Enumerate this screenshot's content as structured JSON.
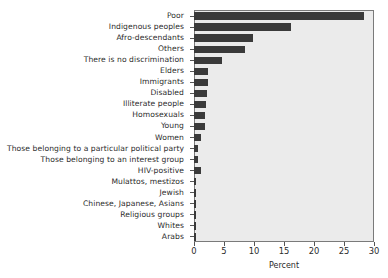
{
  "chart_data": {
    "type": "bar",
    "orientation": "horizontal",
    "title": "",
    "xlabel": "Percent",
    "ylabel": "",
    "xlim": [
      0,
      30
    ],
    "xticks": [
      0,
      5,
      10,
      15,
      20,
      25,
      30
    ],
    "grid": false,
    "legend": null,
    "bar_color": "#3a3a3a",
    "plot_background": "#ebebeb",
    "categories": [
      "Poor",
      "Indigenous peoples",
      "Afro-descendants",
      "Others",
      "There is no discrimination",
      "Elders",
      "Immigrants",
      "Disabled",
      "Illiterate people",
      "Homosexuals",
      "Young",
      "Women",
      "Those belonging to a particular political party",
      "Those belonging to an interest group",
      "HIV-positive",
      "Mulattos, mestizos",
      "Jewish",
      "Chinese, Japanese, Asians",
      "Religious groups",
      "Whites",
      "Arabs"
    ],
    "values": [
      28.3,
      16.2,
      9.8,
      8.5,
      4.7,
      2.4,
      2.4,
      2.1,
      2.0,
      1.9,
      1.8,
      1.2,
      0.7,
      0.6,
      1.1,
      0.4,
      0.3,
      0.3,
      0.3,
      0.25,
      0.25
    ]
  }
}
